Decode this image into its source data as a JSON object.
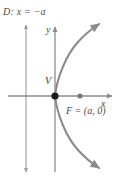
{
  "figure": {
    "type": "parabola-conic-diagram",
    "width": 121,
    "height": 182,
    "background_color": "#ffffff",
    "stroke_color": "#8c8c8c",
    "curve_color": "#8a8a8a",
    "text_color": "#4a4a4a",
    "vertex_dot_color": "#1a1a1a",
    "focus_dot_color": "#7a7a7a"
  },
  "labels": {
    "directrix": "D: x = −a",
    "y_axis": "y",
    "x_axis": "x",
    "vertex": "V",
    "focus": "F = (a, 0)"
  },
  "geometry": {
    "origin": {
      "x": 55,
      "y": 96
    },
    "directrix_x": 26,
    "focus": {
      "x": 80,
      "y": 96
    },
    "vertex": {
      "x": 55,
      "y": 96
    },
    "parabola_opens": "right",
    "parabola_equation": "y^2 = 4ax"
  },
  "icons": {
    "directrix_line": "double-arrow-vertical-line",
    "y_axis_arrow": "arrow-up",
    "x_axis_arrow": "arrow-right",
    "upper_branch_arrow": "arrow-up-right",
    "lower_branch_arrow": "arrow-down-right",
    "vertex_marker": "filled-dot",
    "focus_marker": "filled-dot"
  }
}
